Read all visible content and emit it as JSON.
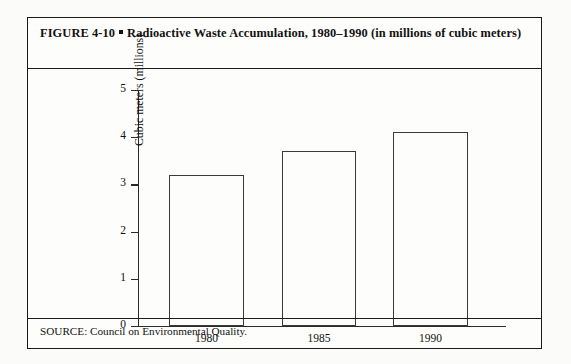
{
  "figure": {
    "label": "FIGURE 4-10",
    "title": "Radioactive Waste Accumulation, 1980–1990 (in millions of cubic meters)",
    "source": "SOURCE: Council on Environmental Quality."
  },
  "chart_data": {
    "type": "bar",
    "title": "Radioactive Waste Accumulation, 1980–1990 (in millions of cubic meters)",
    "categories": [
      "1980",
      "1985",
      "1990"
    ],
    "values": [
      3.2,
      3.7,
      4.1
    ],
    "xlabel": "",
    "ylabel": "Cubic meters (millions)",
    "ylim": [
      0,
      5
    ],
    "yticks": [
      "0",
      "1",
      "2",
      "3",
      "4",
      "5"
    ],
    "grid": false,
    "legend": false,
    "bar_fill": "#fdfdfb",
    "bar_outline": "#3a3a3a",
    "axis_color": "#2a2a2a"
  }
}
